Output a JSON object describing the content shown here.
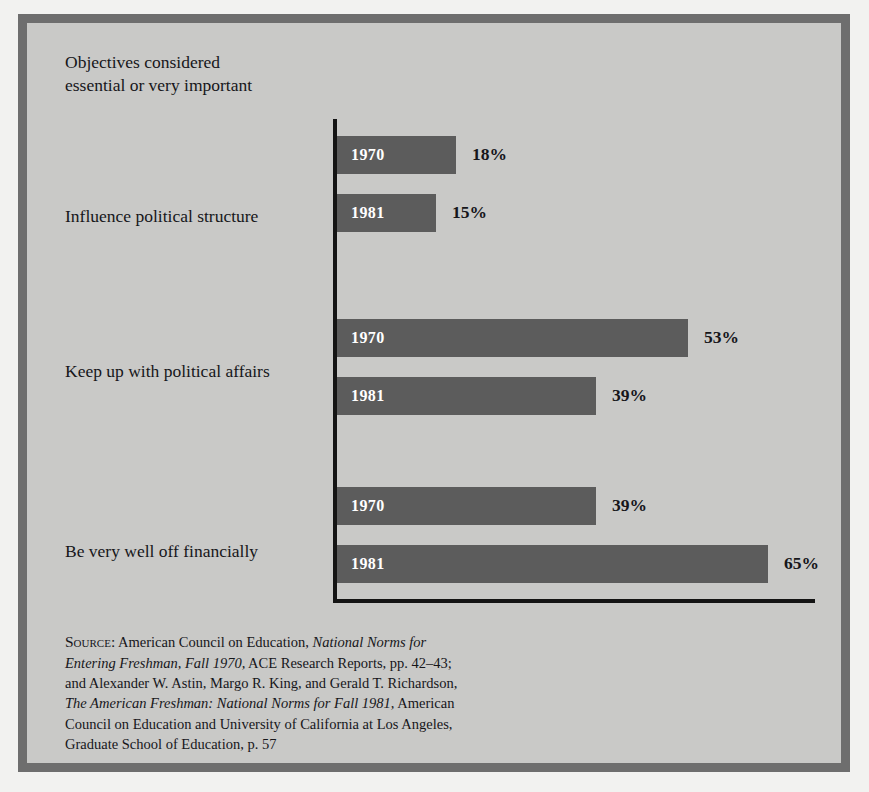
{
  "figure": {
    "title_lines": [
      "Objectives considered",
      "essential or very important"
    ],
    "colors": {
      "plate_background": "#c9c9c7",
      "frame_border": "#6e6e6e",
      "bar_fill": "#5c5c5c",
      "axis": "#141414",
      "text": "#16161a",
      "bar_label_text": "#ffffff"
    }
  },
  "chart_data": {
    "type": "bar",
    "orientation": "horizontal",
    "title": "Objectives considered essential or very important",
    "xlabel": "",
    "ylabel": "",
    "xlim": [
      0,
      65
    ],
    "grid": false,
    "legend_position": "none",
    "value_suffix": "%",
    "categories": [
      "Influence political structure",
      "Keep up with political affairs",
      "Be very well off financially"
    ],
    "series": [
      {
        "name": "1970",
        "values": [
          18,
          53,
          39
        ]
      },
      {
        "name": "1981",
        "values": [
          15,
          39,
          65
        ]
      }
    ],
    "bars": [
      {
        "group": "Influence political structure",
        "year": "1970",
        "value": 18,
        "label": "18%"
      },
      {
        "group": "Influence political structure",
        "year": "1981",
        "value": 15,
        "label": "15%"
      },
      {
        "group": "Keep up with political affairs",
        "year": "1970",
        "value": 53,
        "label": "53%"
      },
      {
        "group": "Keep up with political affairs",
        "year": "1981",
        "value": 39,
        "label": "39%"
      },
      {
        "group": "Be very well off financially",
        "year": "1970",
        "value": 39,
        "label": "39%"
      },
      {
        "group": "Be very well off financially",
        "year": "1981",
        "value": 65,
        "label": "65%"
      }
    ]
  },
  "source": {
    "label": "Source:",
    "line1_rest": " American Council on Education, ",
    "line1_italic": "National Norms for",
    "line2_italic": "Entering Freshman, Fall 1970,",
    "line2_rest": " ACE Research Reports, pp. 42–43;",
    "line3": "and Alexander W. Astin, Margo R. King, and Gerald T. Richardson,",
    "line4_italic": "The American Freshman: National Norms for Fall 1981,",
    "line4_rest": " American",
    "line5": "Council on Education and University of California at Los Angeles,",
    "line6": "Graduate School of Education, p. 57"
  }
}
